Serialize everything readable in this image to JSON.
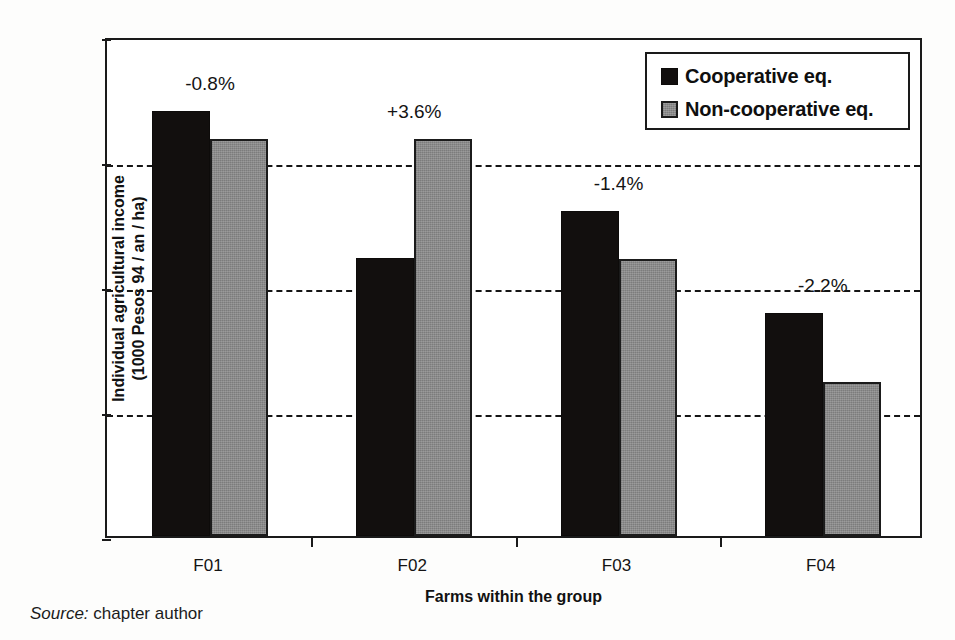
{
  "chart_data": {
    "type": "bar",
    "title": "",
    "xlabel": "Farms within the group",
    "ylabel": "Individual agricultural income (1000 Pesos 94 / an / ha)",
    "ylabel_line1": "Individual agricultural income",
    "ylabel_line2": "(1000 Pesos 94 / an / ha)",
    "categories": [
      "F01",
      "F02",
      "F03",
      "F04"
    ],
    "series": [
      {
        "name": "Cooperative eq.",
        "color": "#120f0e",
        "values": [
          5.48,
          5.245,
          5.32,
          5.157
        ]
      },
      {
        "name": "Non-cooperative eq.",
        "color": "#8a8a8a",
        "values": [
          5.435,
          5.435,
          5.243,
          5.046
        ]
      }
    ],
    "annotations": [
      "-0.8%",
      "+3.6%",
      "-1.4%",
      "-2.2%"
    ],
    "ylim": [
      4.8,
      5.6
    ],
    "yticks": [
      "5.6",
      "5.4",
      "5.2",
      "5.0",
      "4.8"
    ],
    "ytick_values": [
      5.6,
      5.4,
      5.2,
      5.0,
      4.8
    ],
    "gridlines": [
      5.4,
      5.2,
      5.0
    ],
    "grid": true,
    "grid_style": "dashed",
    "legend_position": "top-right"
  },
  "legend": {
    "items": [
      {
        "label": "Cooperative eq."
      },
      {
        "label": "Non-cooperative eq."
      }
    ]
  },
  "caption": {
    "source_word": "Source:",
    "source_text": " chapter author"
  }
}
